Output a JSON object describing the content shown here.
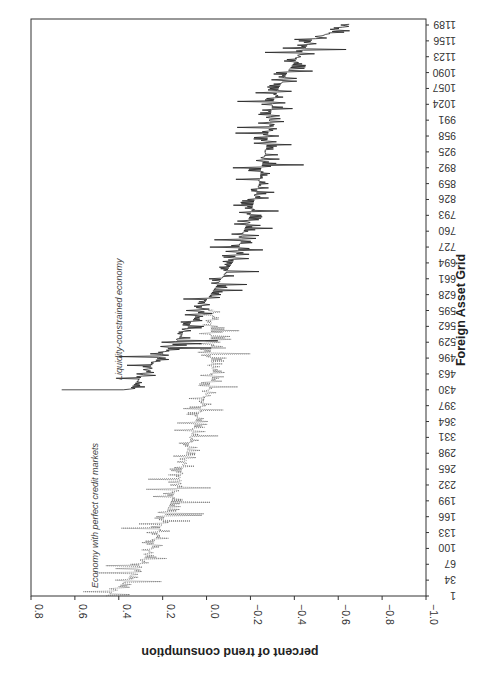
{
  "chart_data": {
    "type": "line",
    "orientation": "rotated 90 degrees (rendered upside-down relative to reading); x grid runs bottom-to-top, y values run left-to-right",
    "title": "",
    "xlabel": "Foreign Asset Grid",
    "ylabel": "percent of trend consumption",
    "ylim": [
      -1.0,
      0.8
    ],
    "y_ticks": [
      "0.8",
      "0.6",
      "0.4",
      "0.2",
      "0.0",
      "−0.2",
      "−0.4",
      "−0.6",
      "−0.8",
      "−1.0"
    ],
    "x_ticks": [
      "1",
      "34",
      "67",
      "100",
      "133",
      "166",
      "199",
      "232",
      "265",
      "298",
      "331",
      "364",
      "397",
      "430",
      "463",
      "496",
      "529",
      "562",
      "595",
      "628",
      "661",
      "694",
      "727",
      "760",
      "793",
      "826",
      "859",
      "892",
      "925",
      "958",
      "991",
      "1024",
      "1057",
      "1090",
      "1123",
      "1156",
      "1189"
    ],
    "grid": false,
    "legend": "none (inline annotations)",
    "annotations": [
      {
        "text": "Economy with perfect credit markets",
        "near_x": 60,
        "series": "Economy with perfect credit markets"
      },
      {
        "text": "Liquidity-constrained economy",
        "near_x": 500,
        "series": "Liquidity-constrained economy"
      }
    ],
    "series": [
      {
        "name": "Economy with perfect credit markets",
        "style": "dotted",
        "x": [
          1,
          34,
          67,
          100,
          133,
          166,
          199,
          232,
          265,
          298,
          331,
          364,
          397,
          430,
          463,
          496,
          529,
          562,
          595
        ],
        "values": [
          0.45,
          0.36,
          0.3,
          0.25,
          0.22,
          0.19,
          0.16,
          0.13,
          0.11,
          0.09,
          0.07,
          0.05,
          0.02,
          -0.01,
          -0.03,
          -0.02,
          -0.02,
          -0.02,
          -0.03
        ]
      },
      {
        "name": "Liquidity-constrained economy",
        "style": "solid",
        "x": [
          430,
          463,
          496,
          529,
          562,
          595,
          628,
          661,
          694,
          727,
          760,
          793,
          826,
          859,
          892,
          925,
          958,
          991,
          1024,
          1057,
          1090,
          1123,
          1156,
          1189
        ],
        "values": [
          0.35,
          0.28,
          0.22,
          0.14,
          0.08,
          0.03,
          -0.02,
          -0.07,
          -0.12,
          -0.15,
          -0.17,
          -0.2,
          -0.22,
          -0.24,
          -0.25,
          -0.27,
          -0.28,
          -0.29,
          -0.3,
          -0.33,
          -0.37,
          -0.42,
          -0.48,
          -0.65
        ],
        "peak": {
          "x": 430,
          "value": 0.66
        }
      }
    ]
  }
}
